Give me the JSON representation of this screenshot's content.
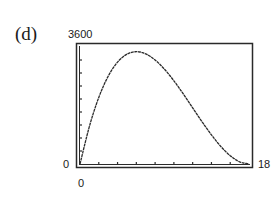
{
  "panel": {
    "label": "(d)"
  },
  "axes": {
    "ymax_label": "3600",
    "ymin_label": "0",
    "xmin_label": "0",
    "xmax_label": "18"
  },
  "colors": {
    "line": "#2a2a2a",
    "frame": "#2a2a2a",
    "background": "#ffffff"
  },
  "chart_data": {
    "type": "line",
    "title": "",
    "xlabel": "",
    "ylabel": "",
    "xlim": [
      0,
      18
    ],
    "ylim": [
      0,
      3600
    ],
    "xscale_ticks": 2,
    "yscale_ticks": 400,
    "grid": false,
    "legend": null,
    "function_hint": "V = x(36 - 2x)^2",
    "series": [
      {
        "name": "V(x)",
        "x": [
          0,
          1,
          2,
          3,
          4,
          5,
          6,
          7,
          8,
          9,
          10,
          11,
          12,
          13,
          14,
          15,
          16,
          17,
          18
        ],
        "values": [
          0,
          1156,
          2048,
          2700,
          3136,
          3380,
          3456,
          3388,
          3200,
          2916,
          2560,
          2156,
          1728,
          1300,
          896,
          540,
          256,
          68,
          0
        ]
      }
    ],
    "annotations": [
      {
        "text": "(d)",
        "role": "panel label"
      }
    ]
  }
}
